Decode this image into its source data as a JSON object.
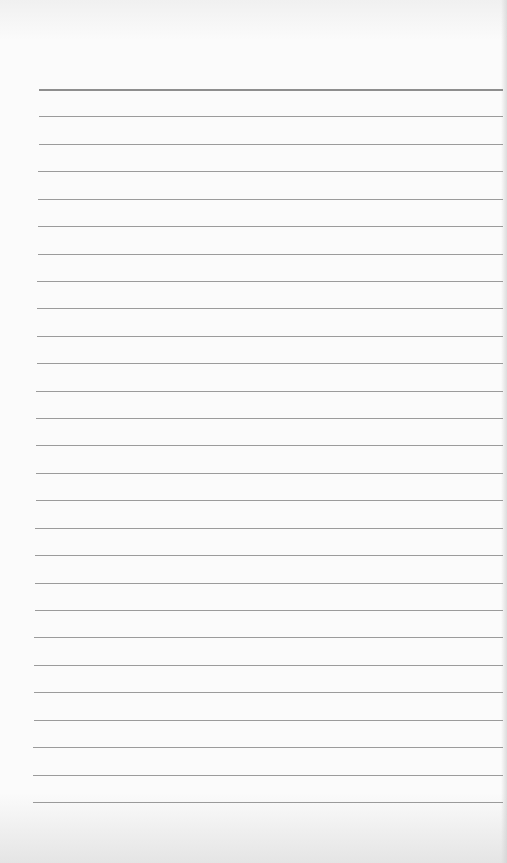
{
  "paper": {
    "type": "lined-paper",
    "line_count": 27,
    "first_line_y": 89,
    "line_spacing": 27.42,
    "line_color": "#8a8a8a",
    "background_color": "#fbfbfb"
  }
}
